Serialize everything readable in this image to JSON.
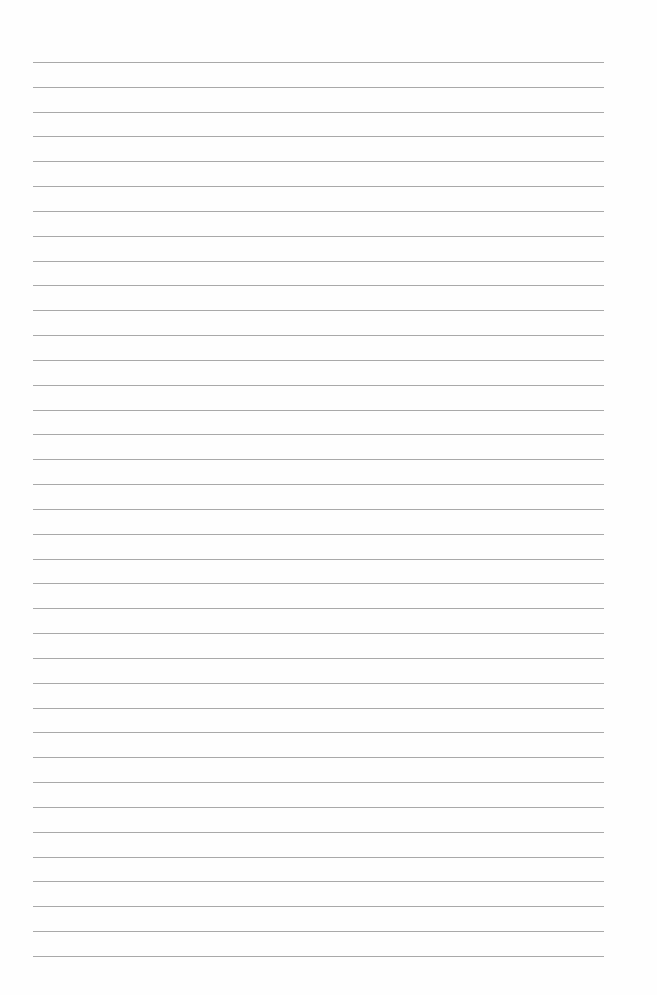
{
  "page": {
    "type": "lined-paper",
    "background_color": "#fefefe",
    "line_color": "#9a9a9a",
    "line_count": 37,
    "first_line_y": 62,
    "line_spacing": 24.83,
    "line_left": 33,
    "line_width": 571
  }
}
